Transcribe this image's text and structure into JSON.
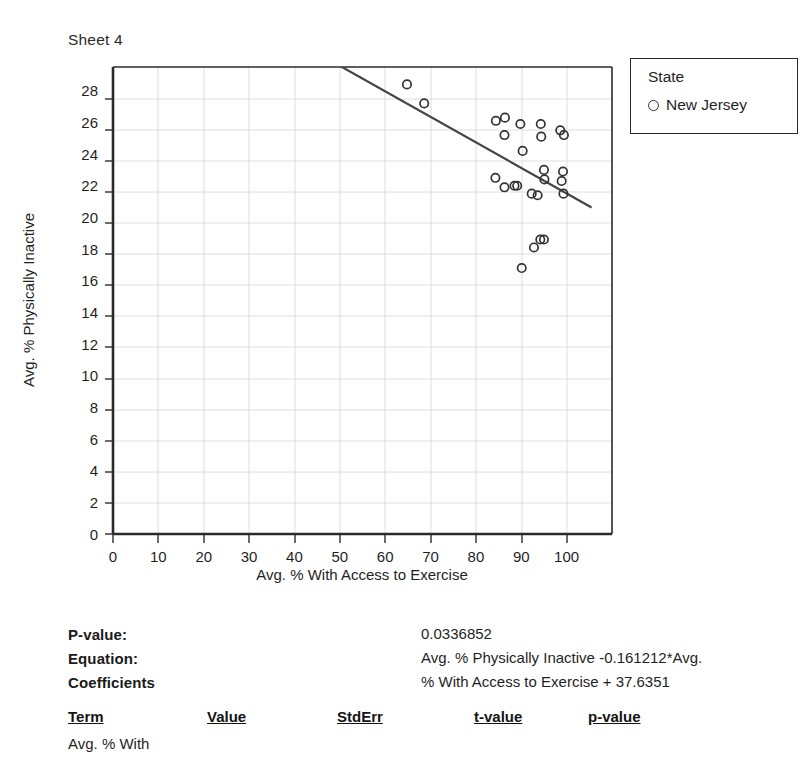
{
  "sheet": {
    "title": "Sheet 4"
  },
  "legend": {
    "title": "State",
    "marker_icon": "circle-outline-icon",
    "entries": [
      {
        "label": "New Jersey"
      }
    ]
  },
  "stats": {
    "pvalue_label": "P-value:",
    "pvalue_value": "0.0336852",
    "equation_label": "Equation:",
    "equation_line1": "Avg. % Physically Inactive -0.161212*Avg.",
    "equation_line2": "% With Access to Exercise + 37.6351",
    "coefficients_label": "Coefficients",
    "columns": [
      "Term",
      "Value",
      "StdErr",
      "t-value",
      "p-value"
    ],
    "rows": [
      {
        "term": "Avg. % With",
        "value": "",
        "stderr": "",
        "tvalue": "",
        "pvalue": ""
      }
    ]
  },
  "chart_data": {
    "type": "scatter",
    "title": "Sheet 4",
    "xlabel": "Avg. % With Access to Exercise",
    "ylabel": "Avg. % Physically Inactive",
    "xlim": [
      0,
      110
    ],
    "ylim": [
      0,
      29.5
    ],
    "xticks": [
      0,
      10,
      20,
      30,
      40,
      50,
      60,
      70,
      80,
      90,
      100
    ],
    "yticks": [
      0,
      2,
      4,
      6,
      8,
      10,
      12,
      14,
      16,
      18,
      20,
      22,
      24,
      26,
      28
    ],
    "grid": true,
    "legend_position": "right-outside",
    "series": [
      {
        "name": "New Jersey",
        "marker": "open-circle",
        "color": "#333333",
        "points": [
          [
            64.8,
            28.4
          ],
          [
            68.6,
            27.2
          ],
          [
            84.4,
            26.1
          ],
          [
            86.4,
            26.3
          ],
          [
            86.3,
            25.2
          ],
          [
            89.8,
            25.9
          ],
          [
            94.3,
            25.9
          ],
          [
            94.4,
            25.1
          ],
          [
            90.3,
            24.2
          ],
          [
            95.0,
            23.0
          ],
          [
            95.1,
            22.4
          ],
          [
            84.3,
            22.5
          ],
          [
            86.3,
            21.9
          ],
          [
            88.5,
            22.0
          ],
          [
            89.1,
            22.0
          ],
          [
            92.3,
            21.5
          ],
          [
            93.6,
            21.4
          ],
          [
            98.6,
            25.5
          ],
          [
            99.4,
            25.2
          ],
          [
            99.2,
            22.9
          ],
          [
            98.9,
            22.3
          ],
          [
            99.3,
            21.5
          ],
          [
            94.2,
            18.6
          ],
          [
            95.0,
            18.6
          ],
          [
            92.8,
            18.1
          ],
          [
            90.1,
            16.8
          ]
        ]
      }
    ],
    "trendline": {
      "equation": "Avg. % Physically Inactive = -0.161212 * Avg. % With Access to Exercise + 37.6351",
      "slope": -0.161212,
      "intercept": 37.6351,
      "x_from": 46.5,
      "x_to": 105.5,
      "pvalue": 0.0336852
    }
  }
}
